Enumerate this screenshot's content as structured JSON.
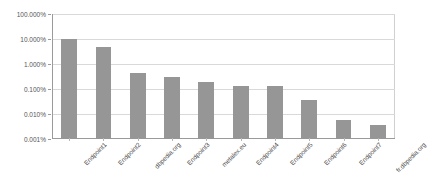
{
  "chart_data": {
    "type": "bar",
    "title": "",
    "xlabel": "",
    "ylabel": "",
    "yscale": "log",
    "ylim": [
      0.001,
      100
    ],
    "grid": true,
    "legend": false,
    "ytick_labels": [
      "100.000%",
      "10.000%",
      "1.000%",
      "0.100%",
      "0.010%",
      "0.001%"
    ],
    "ytick_values": [
      100,
      10,
      1,
      0.1,
      0.01,
      0.001
    ],
    "categories": [
      "Endpoint1",
      "Endpoint2",
      "dbpedia.org",
      "Endpoint3",
      "metalex.eu",
      "Endpoint4",
      "Endpoint5",
      "Endpoint6",
      "Endpoint7",
      "fr.dbpedia.org"
    ],
    "values": [
      10.0,
      5.0,
      0.45,
      0.3,
      0.19,
      0.13,
      0.13,
      0.035,
      0.006,
      0.0035
    ],
    "series_color": "#969696",
    "background_color": "#ffffff",
    "gridline_color": "#d9d9d9",
    "axis_color": "#9a9a9a"
  }
}
